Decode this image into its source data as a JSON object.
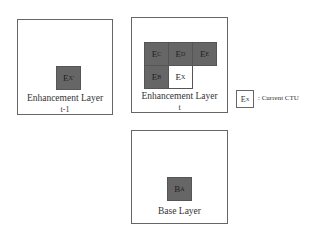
{
  "diagram": {
    "prev_layer": {
      "label": "Enhancement Layer",
      "sublabel": "t-1",
      "block": {
        "main": "E",
        "sub": "X",
        "sup": "'"
      }
    },
    "curr_layer": {
      "label": "Enhancement Layer",
      "sublabel": "t",
      "blocks": [
        {
          "main": "E",
          "sub": "C",
          "current": false
        },
        {
          "main": "E",
          "sub": "D",
          "current": false
        },
        {
          "main": "E",
          "sub": "E",
          "current": false
        },
        {
          "main": "E",
          "sub": "B",
          "current": false
        },
        {
          "main": "E",
          "sub": "X",
          "current": true
        }
      ]
    },
    "base_layer": {
      "label": "Base Layer",
      "block": {
        "main": "B",
        "sub": "A"
      }
    },
    "legend": {
      "symbol_main": "E",
      "symbol_sub": "X",
      "text": ": Current CTU"
    },
    "colors": {
      "block_fill": "#666666",
      "border": "#555555",
      "current_fill": "#ffffff"
    }
  }
}
